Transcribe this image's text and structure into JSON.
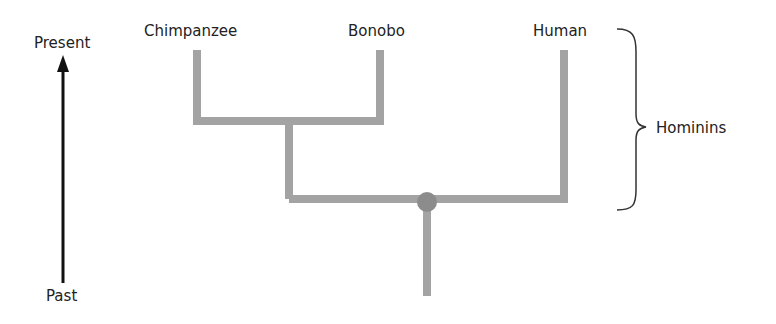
{
  "diagram": {
    "type": "phylogenetic-tree",
    "time_axis": {
      "top_label": "Present",
      "bottom_label": "Past",
      "arrow_direction": "up"
    },
    "taxa": [
      {
        "name": "Chimpanzee"
      },
      {
        "name": "Bonobo"
      },
      {
        "name": "Human"
      }
    ],
    "bracket": {
      "label": "Hominins"
    },
    "colors": {
      "branch": "#a3a3a3",
      "node": "#8c8c8c",
      "arrow": "#111111",
      "text": "#222222",
      "bracket": "#333333"
    }
  }
}
